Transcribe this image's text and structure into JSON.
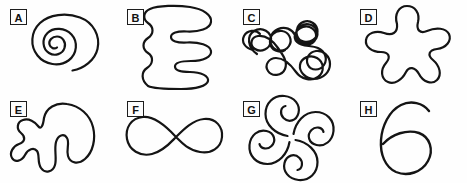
{
  "figure": {
    "title": "",
    "background_color": "#fefefe",
    "stroke_color": "#141414",
    "width": 467,
    "height": 183,
    "columns": 4,
    "rows": 2
  },
  "panels": [
    {
      "label": "A",
      "shape_name": "spiral",
      "description": "Archimedean spiral with about three turns, open tail at lower right",
      "x": 0,
      "y": 0,
      "stroke_width": 2.2
    },
    {
      "label": "B",
      "shape_name": "meander-serpentine",
      "description": "Vertical serpentine meander with horizontal switchbacks, open ends",
      "x": 117,
      "y": 0,
      "stroke_width": 2.2
    },
    {
      "label": "C",
      "shape_name": "tangled-scribble",
      "description": "Complex self-crossing scribble with many small loops",
      "x": 233,
      "y": 0,
      "stroke_width": 2.2
    },
    {
      "label": "D",
      "shape_name": "amoeba-blob",
      "description": "Closed five-lobed amoeba blob with rounded arms",
      "x": 350,
      "y": 0,
      "stroke_width": 2.2
    },
    {
      "label": "E",
      "shape_name": "irregular-blob",
      "description": "Closed irregular blob with deep notch on lower edge",
      "x": 0,
      "y": 92,
      "stroke_width": 2.2
    },
    {
      "label": "F",
      "shape_name": "figure-eight",
      "description": "Smooth figure-eight / infinity curve with single crossing",
      "x": 117,
      "y": 92,
      "stroke_width": 2.2
    },
    {
      "label": "G",
      "shape_name": "pinwheel-four-lobe",
      "description": "Four-fold rotationally symmetric pinwheel of comma lobes",
      "x": 233,
      "y": 92,
      "stroke_width": 2.2
    },
    {
      "label": "H",
      "shape_name": "six-loop",
      "description": "Single loop with upward tail resembling the numeral six",
      "x": 350,
      "y": 92,
      "stroke_width": 2.2
    }
  ]
}
